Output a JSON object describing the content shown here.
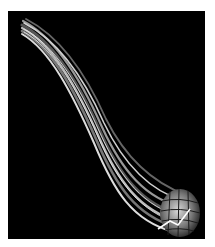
{
  "figure": {
    "background": "#000000",
    "page_background": "#ffffff",
    "bundle": {
      "color_light": "#e6e6e6",
      "color_mid": "#8a8a8a",
      "color_dark": "#3a3a3a",
      "strand_count": 7
    },
    "end_cap": {
      "shape": "meshed-bulb",
      "highlight": "#ffffff"
    }
  }
}
